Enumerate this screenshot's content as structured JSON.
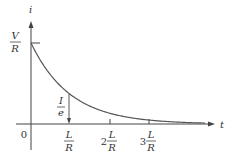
{
  "chart_data": {
    "type": "line",
    "title": "",
    "xlabel": "t",
    "ylabel": "i",
    "y_tick_label": {
      "num": "V",
      "den": "R"
    },
    "annotation": {
      "num": "I",
      "den": "e"
    },
    "origin_label": "0",
    "x_ticks": [
      {
        "coef": "",
        "num": "L",
        "den": "R",
        "value": 1
      },
      {
        "coef": "2",
        "num": "L",
        "den": "R",
        "value": 2
      },
      {
        "coef": "3",
        "num": "L",
        "den": "R",
        "value": 3
      }
    ],
    "curve": "i = (V/R) e^(-t/(L/R))",
    "series": [
      {
        "name": "current decay",
        "x": [
          0,
          0.5,
          1,
          1.5,
          2,
          2.5,
          3,
          3.5,
          4
        ],
        "values": [
          1.0,
          0.607,
          0.368,
          0.223,
          0.135,
          0.082,
          0.05,
          0.03,
          0.018
        ]
      }
    ],
    "grid": false
  }
}
